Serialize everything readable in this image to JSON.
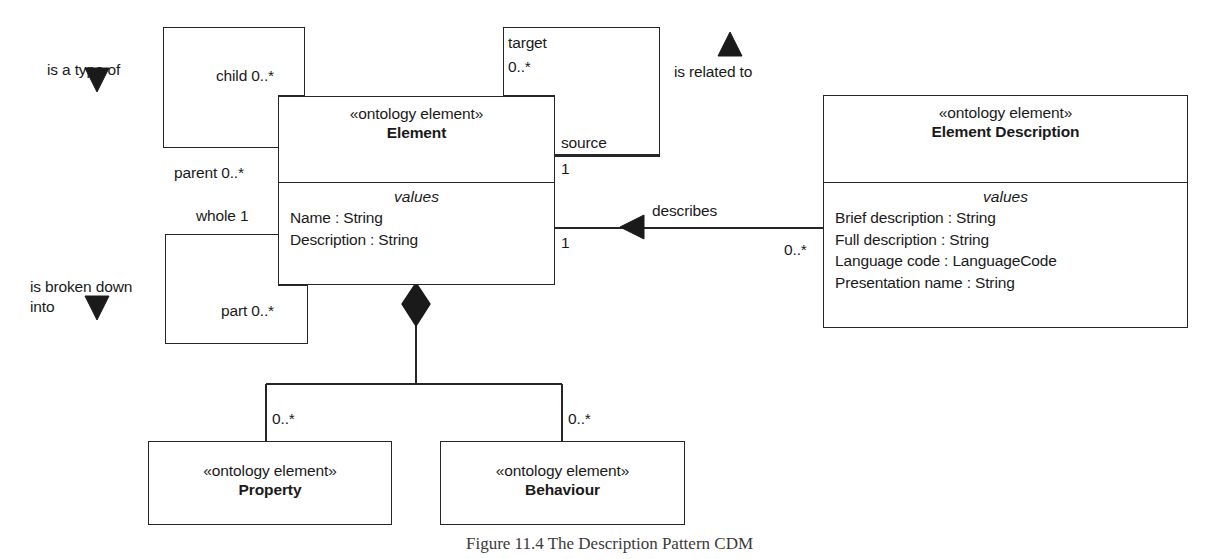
{
  "diagram": {
    "title": "The Description Pattern CDM",
    "caption": "Figure 11.4  The Description Pattern CDM"
  },
  "classes": {
    "element": {
      "stereotype": "«ontology element»",
      "name": "Element",
      "compartment_label": "values",
      "attributes": [
        "Name : String",
        "Description : String"
      ]
    },
    "element_description": {
      "stereotype": "«ontology element»",
      "name": "Element Description",
      "compartment_label": "values",
      "attributes": [
        "Brief description : String",
        "Full description : String",
        "Language code : LanguageCode",
        "Presentation name : String"
      ]
    },
    "property": {
      "stereotype": "«ontology element»",
      "name": "Property"
    },
    "behaviour": {
      "stereotype": "«ontology element»",
      "name": "Behaviour"
    }
  },
  "associations": {
    "generalization": {
      "label": "is a type of",
      "role_child": "child 0..*",
      "role_parent": "parent 0..*"
    },
    "composition_self": {
      "label_line1": "is broken down",
      "label_line2": "into",
      "role_whole": "whole 1",
      "role_part": "part 0..*"
    },
    "related_to": {
      "label": "is related to",
      "role_target": "target",
      "role_target_mult": "0..*",
      "role_source": "source",
      "role_source_mult": "1"
    },
    "describes": {
      "label": "describes",
      "mult_element": "1",
      "mult_description": "0..*"
    },
    "aggregation": {
      "mult_property": "0..*",
      "mult_behaviour": "0..*"
    }
  },
  "style": {
    "line_color": "#262626",
    "fill_color": "#ffffff",
    "text_color": "#1a1a1a"
  }
}
